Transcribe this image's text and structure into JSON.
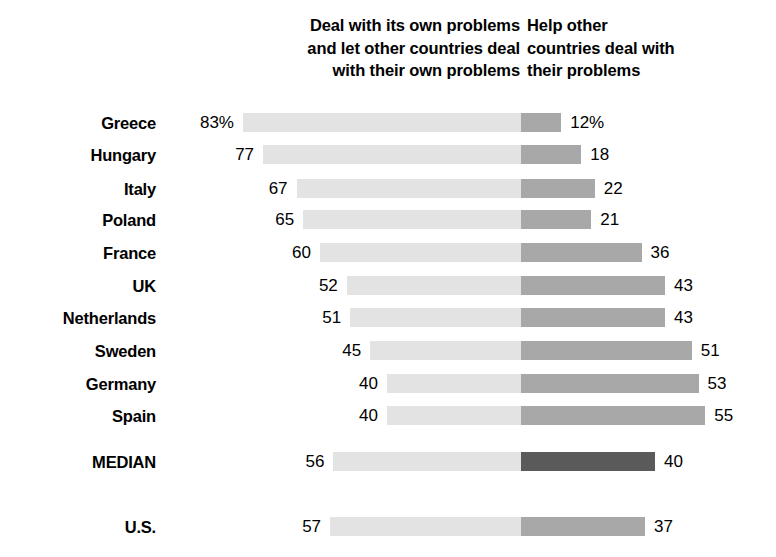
{
  "header": {
    "left_column": [
      "Deal with its own problems",
      "and let other countries deal",
      "with their own problems"
    ],
    "right_column": [
      "Help other",
      "countries deal with",
      "their problems"
    ]
  },
  "colors": {
    "bar_left": "#e3e3e3",
    "bar_right": "#a8a8a8",
    "bar_right_median": "#5a5a5a",
    "text": "#000000",
    "background": "#ffffff"
  },
  "chart_data": {
    "type": "bar",
    "title": "",
    "subtitle": "",
    "xlabel": "",
    "ylabel": "",
    "orientation": "horizontal",
    "layout": "diverging-stacked",
    "grid": false,
    "legend_position": "top",
    "center_divider_x": 521,
    "px_per_percent": 3.35,
    "categories": [
      "Greece",
      "Hungary",
      "Italy",
      "Poland",
      "France",
      "UK",
      "Netherlands",
      "Sweden",
      "Germany",
      "Spain",
      "MEDIAN",
      "U.S."
    ],
    "series": [
      {
        "name": "Deal with its own problems and let other countries deal with their own problems",
        "values": [
          83,
          77,
          67,
          65,
          60,
          52,
          51,
          45,
          40,
          40,
          56,
          57
        ]
      },
      {
        "name": "Help other countries deal with their problems",
        "values": [
          12,
          18,
          22,
          21,
          36,
          43,
          43,
          51,
          53,
          55,
          40,
          37
        ]
      }
    ]
  },
  "rows": [
    {
      "label": "Greece",
      "left_value": 83,
      "right_value": 12,
      "left_text": "83%",
      "right_text": "12%",
      "y": 108,
      "emphasis": false
    },
    {
      "label": "Hungary",
      "left_value": 77,
      "right_value": 18,
      "left_text": "77",
      "right_text": "18",
      "y": 140,
      "emphasis": false
    },
    {
      "label": "Italy",
      "left_value": 67,
      "right_value": 22,
      "left_text": "67",
      "right_text": "22",
      "y": 174,
      "emphasis": false
    },
    {
      "label": "Poland",
      "left_value": 65,
      "right_value": 21,
      "left_text": "65",
      "right_text": "21",
      "y": 205,
      "emphasis": false
    },
    {
      "label": "France",
      "left_value": 60,
      "right_value": 36,
      "left_text": "60",
      "right_text": "36",
      "y": 238,
      "emphasis": false
    },
    {
      "label": "UK",
      "left_value": 52,
      "right_value": 43,
      "left_text": "52",
      "right_text": "43",
      "y": 271,
      "emphasis": false
    },
    {
      "label": "Netherlands",
      "left_value": 51,
      "right_value": 43,
      "left_text": "51",
      "right_text": "43",
      "y": 303,
      "emphasis": false
    },
    {
      "label": "Sweden",
      "left_value": 45,
      "right_value": 51,
      "left_text": "45",
      "right_text": "51",
      "y": 336,
      "emphasis": false
    },
    {
      "label": "Germany",
      "left_value": 40,
      "right_value": 53,
      "left_text": "40",
      "right_text": "53",
      "y": 369,
      "emphasis": false
    },
    {
      "label": "Spain",
      "left_value": 40,
      "right_value": 55,
      "left_text": "40",
      "right_text": "55",
      "y": 401,
      "emphasis": false
    },
    {
      "label": "MEDIAN",
      "left_value": 56,
      "right_value": 40,
      "left_text": "56",
      "right_text": "40",
      "y": 447,
      "emphasis": true
    },
    {
      "label": "U.S.",
      "left_value": 57,
      "right_value": 37,
      "left_text": "57",
      "right_text": "37",
      "y": 512,
      "emphasis": false
    }
  ]
}
